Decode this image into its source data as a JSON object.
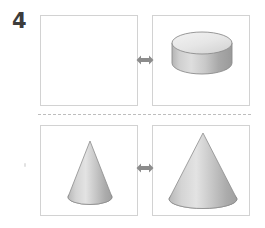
{
  "page": {
    "background_color": "#ffffff",
    "width": 265,
    "height": 228
  },
  "question": {
    "number": "4",
    "number_color": "#3c3c3c"
  },
  "divider": {
    "style": "dashed",
    "color": "#bdbdbd"
  },
  "panels": [
    {
      "id": "top-left",
      "position": "top-left",
      "content": "empty",
      "shape": null,
      "border_color": "#d2d2d2",
      "fill_color": "#ffffff"
    },
    {
      "id": "top-right",
      "position": "top-right",
      "content": "shape",
      "shape": "cylinder",
      "shape_label": "short wide cylinder",
      "border_color": "#d2d2d2",
      "fill_color": "#ffffff"
    },
    {
      "id": "bottom-left",
      "position": "bottom-left",
      "content": "shape",
      "shape": "cone",
      "shape_label": "narrow tall cone",
      "border_color": "#d2d2d2",
      "fill_color": "#ffffff"
    },
    {
      "id": "bottom-right",
      "position": "bottom-right",
      "content": "shape",
      "shape": "cone",
      "shape_label": "wide large cone",
      "border_color": "#d2d2d2",
      "fill_color": "#ffffff"
    }
  ],
  "arrows": [
    {
      "id": "arrow-top",
      "icon": "double-headed-arrow-icon",
      "color": "#8c8c8c",
      "direction": "left-right"
    },
    {
      "id": "arrow-bottom",
      "icon": "double-headed-arrow-icon",
      "color": "#8c8c8c",
      "direction": "left-right"
    }
  ],
  "shapes": {
    "cylinder": {
      "name": "cylinder",
      "top_face_color": "#e8e8e8",
      "body_light_color": "#d9d9d9",
      "body_dark_color": "#a0a0a0",
      "outline_color": "#8a8a8a"
    },
    "cone_small": {
      "name": "cone",
      "light_color": "#e0e0e0",
      "dark_color": "#a8a8a8",
      "outline_color": "#8a8a8a"
    },
    "cone_large": {
      "name": "cone",
      "light_color": "#e0e0e0",
      "dark_color": "#a8a8a8",
      "outline_color": "#8a8a8a"
    }
  }
}
